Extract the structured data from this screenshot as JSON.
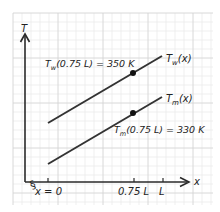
{
  "diagram": {
    "axes": {
      "y_label": "T",
      "x_label": "x",
      "x_ticks": [
        {
          "label": "x = 0",
          "value": 0
        },
        {
          "label": "0.75 L",
          "value": 0.75
        },
        {
          "label": "L",
          "value": 1.0
        }
      ],
      "axis_break_symbol": "§"
    },
    "curves": [
      {
        "name": "T_w(x)",
        "label_main": "T",
        "label_sub": "w",
        "label_arg": "(x)",
        "color": "#333333"
      },
      {
        "name": "T_m(x)",
        "label_main": "T",
        "label_sub": "m",
        "label_arg": "(x)",
        "color": "#333333"
      }
    ],
    "annotations": [
      {
        "main": "T",
        "sub": "w",
        "rest": "(0.75 L) = 350 K",
        "point": {
          "x": "0.75 L",
          "T": "350 K"
        }
      },
      {
        "main": "T",
        "sub": "m",
        "rest": "(0.75 L) = 330 K",
        "point": {
          "x": "0.75 L",
          "T": "330 K"
        }
      }
    ],
    "colors": {
      "grid_minor": "#e6e6e6",
      "grid_major": "#d2d2d2",
      "axis": "#2a2a2a",
      "line": "#333333",
      "point": "#111111"
    }
  }
}
